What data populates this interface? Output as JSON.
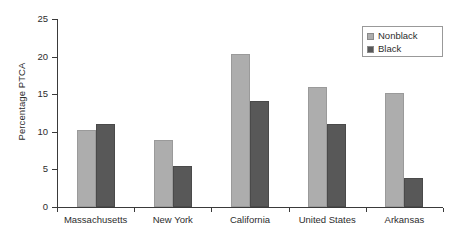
{
  "chart_data": {
    "type": "bar",
    "title": "",
    "subtitle": "",
    "xlabel": "",
    "ylabel": "Percentage PTCA",
    "ylim": [
      0,
      25
    ],
    "yticks": [
      0,
      5,
      10,
      15,
      20,
      25
    ],
    "ytick_labels": [
      "0",
      "5",
      "10",
      "15",
      "20",
      "25"
    ],
    "grid": false,
    "legend_position": "top-right",
    "categories": [
      "Massachusetts",
      "New York",
      "California",
      "United States",
      "Arkansas"
    ],
    "series": [
      {
        "name": "Nonblack",
        "color": "#adadad",
        "values": [
          10.2,
          8.9,
          20.4,
          15.9,
          15.2
        ]
      },
      {
        "name": "Black",
        "color": "#585858",
        "values": [
          11.0,
          5.5,
          14.1,
          11.0,
          3.8
        ]
      }
    ]
  },
  "legend": {
    "entries": [
      {
        "label": "Nonblack",
        "swatch": "nonblack"
      },
      {
        "label": "Black",
        "swatch": "black"
      }
    ]
  },
  "colors": {
    "nonblack": "#adadad",
    "black": "#585858",
    "axis": "#3a3a3a",
    "text": "#2d2d2d",
    "background": "#ffffff"
  }
}
